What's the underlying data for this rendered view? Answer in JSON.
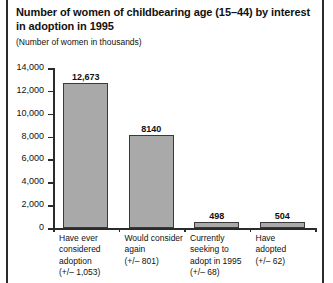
{
  "chart_data": {
    "type": "bar",
    "title": "Number of women of childbearing age (15–44) by interest in adoption in 1995",
    "subtitle": "(Number of women in thousands)",
    "xlabel": "",
    "ylabel": "",
    "ylim": [
      0,
      14000
    ],
    "grid": false,
    "legend": false,
    "ytick_labels": [
      "14,000",
      "12,000",
      "10,000",
      "8,000",
      "6,000",
      "4,000",
      "2,000",
      "0"
    ],
    "ytick_values": [
      14000,
      12000,
      10000,
      8000,
      6000,
      4000,
      2000,
      0
    ],
    "categories": [
      "Have ever considered adoption (+/– 1,053)",
      "Would consider again (+/– 801)",
      "Currently seeking to adopt in 1995 (+/– 68)",
      "Have adopted (+/– 62)"
    ],
    "category_lines": [
      [
        "Have ever",
        "considered",
        "adoption",
        "(+/– 1,053)"
      ],
      [
        "Would consider",
        "again",
        "(+/– 801)"
      ],
      [
        "Currently",
        "seeking to",
        "adopt in 1995",
        "(+/– 68)"
      ],
      [
        "Have",
        "adopted",
        "(+/– 62)"
      ]
    ],
    "values": [
      12673,
      8140,
      498,
      504
    ],
    "value_labels": [
      "12,673",
      "8140",
      "498",
      "504"
    ],
    "margins_of_error": [
      1053,
      801,
      68,
      62
    ],
    "bar_color": "#a9a9a9",
    "bar_edge_color": "#3a3a3a",
    "axis_color": "#2b2b2b",
    "background_color": "#ffffff"
  }
}
